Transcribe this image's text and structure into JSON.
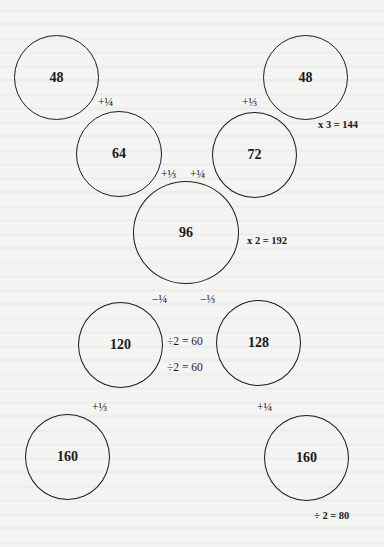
{
  "circles": [
    {
      "id": "c1",
      "value": "48"
    },
    {
      "id": "c2",
      "value": "48"
    },
    {
      "id": "c3",
      "value": "64"
    },
    {
      "id": "c4",
      "value": "72"
    },
    {
      "id": "c5",
      "value": "96"
    },
    {
      "id": "c6",
      "value": "120"
    },
    {
      "id": "c7",
      "value": "128"
    },
    {
      "id": "c8",
      "value": "160"
    },
    {
      "id": "c9",
      "value": "160"
    }
  ],
  "labels": {
    "plus_quarter_top": "+¼",
    "plus_third_top": "+⅓",
    "times3": "x 3 = 144",
    "plus_third_mid": "+⅓",
    "plus_quarter_mid": "+¼",
    "times2": "x 2 = 192",
    "minus_quarter": "−¼",
    "minus_third": "−⅓",
    "div2_60_a": "÷2 = 60",
    "div2_60_b": "÷2 = 60",
    "plus_third_bottom": "+⅓",
    "plus_quarter_bottom": "+¼",
    "div2_80": "÷ 2 = 80"
  }
}
